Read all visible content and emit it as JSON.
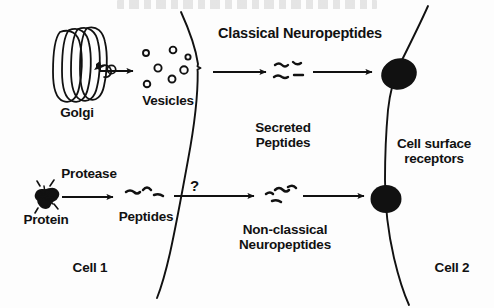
{
  "figure": {
    "title_cropped": "",
    "background_color": "#fdfdfd",
    "ink_color": "#111111"
  },
  "cells": {
    "left": {
      "label": "Cell 1"
    },
    "right": {
      "label": "Cell 2"
    }
  },
  "pathways": {
    "classical": {
      "heading": "Classical Neuropeptides",
      "organelle_label": "Golgi",
      "carrier_label": "Vesicles",
      "secreted_label_line1": "Secreted",
      "secreted_label_line2": "Peptides"
    },
    "nonclassical": {
      "enzyme_label": "Protease",
      "substrate_label": "Protein",
      "product_label": "Peptides",
      "transport_question": "?",
      "heading_line1": "Non-classical",
      "heading_line2": "Neuropeptides"
    }
  },
  "receptors": {
    "label_line1": "Cell surface",
    "label_line2": "receptors",
    "count": 2
  },
  "counts": {
    "vesicles": 7,
    "golgi_cisternae": 4,
    "classical_peptide_squiggles": 4,
    "nonclassical_peptide_squiggles": 4,
    "source_peptide_squiggles": 3
  }
}
